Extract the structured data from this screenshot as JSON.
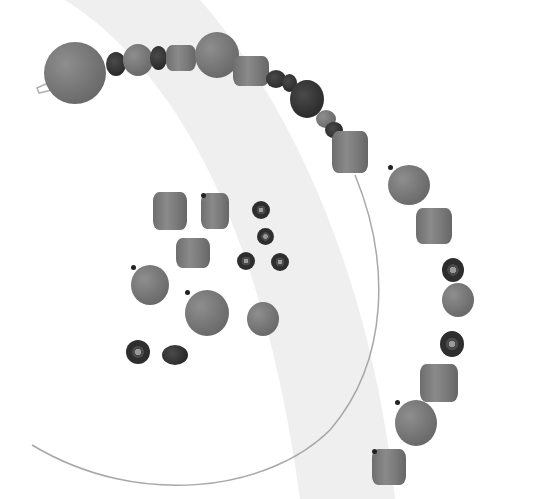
{
  "image": {
    "description": "Grayscale photo of loose and strung clay/glass beads on white background with light gray curved band and thin wire arc",
    "colors": {
      "background": "#ffffff",
      "band": "#efefef",
      "bead_light": "#808080",
      "bead_dark": "#2e2e2e",
      "wire": "#a8a8a8"
    }
  },
  "beads": {
    "strung": [
      {
        "type": "round",
        "x": 44,
        "y": 42,
        "w": 62,
        "h": 62
      },
      {
        "type": "dark",
        "x": 106,
        "y": 52,
        "w": 20,
        "h": 24
      },
      {
        "type": "round",
        "x": 123,
        "y": 44,
        "w": 30,
        "h": 32
      },
      {
        "type": "dark",
        "x": 150,
        "y": 46,
        "w": 17,
        "h": 24
      },
      {
        "type": "barrel",
        "x": 166,
        "y": 45,
        "w": 30,
        "h": 26
      },
      {
        "type": "round",
        "x": 195,
        "y": 32,
        "w": 44,
        "h": 46
      },
      {
        "type": "barrel",
        "x": 233,
        "y": 56,
        "w": 36,
        "h": 30
      },
      {
        "type": "dark",
        "x": 266,
        "y": 70,
        "w": 20,
        "h": 18
      },
      {
        "type": "dark",
        "x": 282,
        "y": 74,
        "w": 15,
        "h": 18
      },
      {
        "type": "dark",
        "x": 290,
        "y": 80,
        "w": 34,
        "h": 38
      },
      {
        "type": "round",
        "x": 316,
        "y": 110,
        "w": 20,
        "h": 18
      },
      {
        "type": "dark",
        "x": 325,
        "y": 122,
        "w": 18,
        "h": 16
      },
      {
        "type": "barrel",
        "x": 332,
        "y": 131,
        "w": 36,
        "h": 42
      }
    ],
    "loose": [
      {
        "type": "round",
        "x": 388,
        "y": 165,
        "w": 42,
        "h": 40,
        "hole": true
      },
      {
        "type": "barrel",
        "x": 416,
        "y": 208,
        "w": 36,
        "h": 36
      },
      {
        "type": "barrel",
        "x": 153,
        "y": 192,
        "w": 34,
        "h": 38
      },
      {
        "type": "barrel",
        "x": 201,
        "y": 193,
        "w": 28,
        "h": 36,
        "hole": true
      },
      {
        "type": "ring",
        "x": 252,
        "y": 201,
        "w": 18,
        "h": 18
      },
      {
        "type": "ring",
        "x": 257,
        "y": 228,
        "w": 17,
        "h": 17
      },
      {
        "type": "barrel",
        "x": 176,
        "y": 238,
        "w": 34,
        "h": 30
      },
      {
        "type": "ring",
        "x": 237,
        "y": 252,
        "w": 18,
        "h": 18
      },
      {
        "type": "ring",
        "x": 271,
        "y": 253,
        "w": 18,
        "h": 18
      },
      {
        "type": "round",
        "x": 131,
        "y": 265,
        "w": 38,
        "h": 40,
        "hole": true
      },
      {
        "type": "round",
        "x": 185,
        "y": 290,
        "w": 44,
        "h": 46,
        "hole": true
      },
      {
        "type": "round",
        "x": 247,
        "y": 302,
        "w": 32,
        "h": 34
      },
      {
        "type": "ring",
        "x": 126,
        "y": 340,
        "w": 24,
        "h": 24
      },
      {
        "type": "dark",
        "x": 162,
        "y": 345,
        "w": 26,
        "h": 20
      },
      {
        "type": "ring",
        "x": 442,
        "y": 258,
        "w": 22,
        "h": 24
      },
      {
        "type": "round",
        "x": 442,
        "y": 283,
        "w": 32,
        "h": 34
      },
      {
        "type": "ring",
        "x": 440,
        "y": 331,
        "w": 24,
        "h": 26
      },
      {
        "type": "barrel",
        "x": 420,
        "y": 364,
        "w": 38,
        "h": 38
      },
      {
        "type": "round",
        "x": 395,
        "y": 400,
        "w": 42,
        "h": 46,
        "hole": true
      },
      {
        "type": "barrel",
        "x": 372,
        "y": 449,
        "w": 34,
        "h": 36,
        "hole": true
      }
    ]
  }
}
